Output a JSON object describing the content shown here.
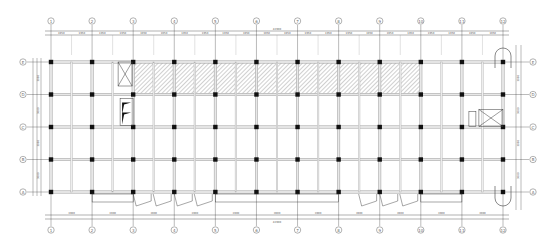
{
  "drawing": {
    "type": "structural floor plan",
    "column_axes": [
      "1",
      "2",
      "3",
      "4",
      "5",
      "6",
      "7",
      "8",
      "9",
      "10",
      "11",
      "12"
    ],
    "row_axes": [
      "E",
      "D",
      "C",
      "B",
      "A"
    ],
    "top_span_labels": [
      "3900",
      "3900",
      "3900",
      "3900",
      "3900",
      "3900",
      "3900",
      "3900",
      "3900",
      "3900",
      "3900"
    ],
    "top_subspan_labels": [
      "1950",
      "1950",
      "1950",
      "1950",
      "1950",
      "1950",
      "1950",
      "1950",
      "1950",
      "1950",
      "1950",
      "1950",
      "1950",
      "1950",
      "1950",
      "1950",
      "1950",
      "1950",
      "1950",
      "1950",
      "1950",
      "1950"
    ],
    "top_overall_label": "42900",
    "bottom_span_labels": [
      "3900",
      "3900",
      "3900",
      "3900",
      "3900",
      "3900",
      "3900",
      "3900",
      "3900",
      "3900",
      "3900"
    ],
    "bottom_overall_label": "42900",
    "left_span_labels": [
      "3000",
      "3000",
      "3000",
      "3000"
    ],
    "right_span_labels": [
      "3000",
      "3000",
      "3000",
      "3000"
    ],
    "hatched_zone_label": "",
    "line_color": "#3a3a3a",
    "beam_color": "#9a9a9a",
    "column_color": "#111111",
    "hatch_color": "#8a8a8a"
  }
}
